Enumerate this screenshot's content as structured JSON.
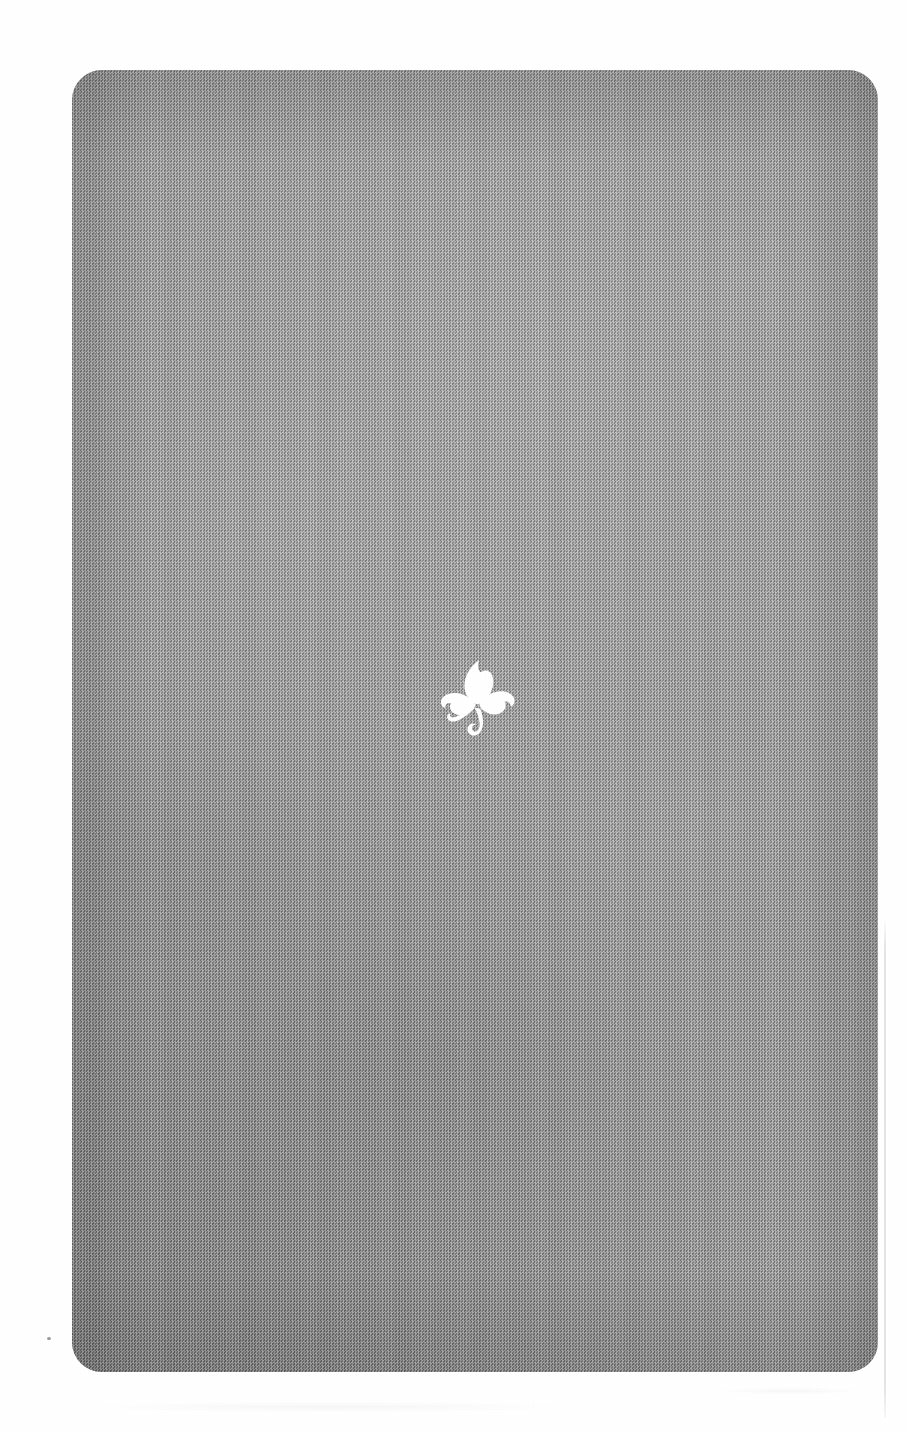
{
  "page": {
    "width": 908,
    "height": 1437,
    "background_color": "#ffffff"
  },
  "plate": {
    "name": "gray-plate",
    "x": 72,
    "y": 70,
    "width": 806,
    "height": 1302,
    "corner_radius": 30,
    "base_color": "#9a9a9a",
    "shadow_color": "#8a8a8a",
    "highlight_color": "#a8a8a8",
    "texture": "halftone-dither"
  },
  "emblem": {
    "name": "shamrock-emblem",
    "icon": "shamrock-icon",
    "shape": "trefoil",
    "leaf_count": 3,
    "has_curled_stem": true,
    "color": "#ffffff",
    "center_x": 477,
    "center_y": 695,
    "width": 82,
    "height": 96
  },
  "artifacts": {
    "edge_line": {
      "name": "scan-edge-line",
      "x": 884,
      "y": 918,
      "height": 500,
      "color": "#000000"
    },
    "speck": {
      "name": "scan-speck",
      "x": 47,
      "y": 1337
    }
  },
  "caption": "Plate with white shamrock emblem centered on a gray textured ground."
}
